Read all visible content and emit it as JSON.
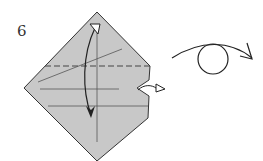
{
  "diagram": {
    "step_number": "6",
    "paper_color": "#c8c8c8",
    "line_color": "#333333",
    "instructions": {
      "valley_fold": "dashed horizontal line",
      "fold_arrow": "fold bottom up to top and back",
      "pull_arrow": "pull out layer on right side",
      "turn_over_symbol": "turn model over"
    }
  }
}
